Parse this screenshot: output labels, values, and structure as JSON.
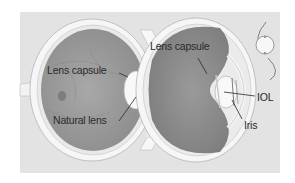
{
  "diagram": {
    "type": "anatomical-illustration",
    "panel_color": "#e4e4e4",
    "left_eye": {
      "labels": [
        {
          "id": "lens-capsule-left",
          "text": "Lens capsule"
        },
        {
          "id": "natural-lens",
          "text": "Natural lens"
        }
      ]
    },
    "right_eye": {
      "labels": [
        {
          "id": "lens-capsule-right",
          "text": "Lens capsule"
        },
        {
          "id": "iol",
          "text": "IOL"
        },
        {
          "id": "iris",
          "text": "Iris"
        }
      ]
    },
    "inset": {
      "description": "IOL implant with haptics"
    }
  }
}
